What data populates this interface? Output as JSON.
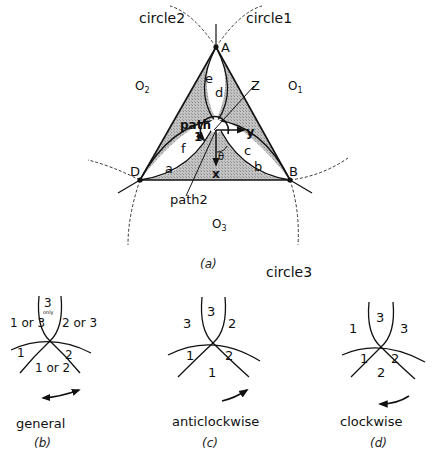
{
  "figure_a": {
    "caption": "(a)",
    "circle_labels": {
      "circle1": "circle1",
      "circle2": "circle2",
      "circle3": "circle3"
    },
    "points": {
      "A": "A",
      "B": "B",
      "D": "D",
      "Z": "Z"
    },
    "centers": {
      "O1": "O",
      "O1_sub": "1",
      "O2": "O",
      "O2_sub": "2",
      "O3": "O",
      "O3_sub": "3"
    },
    "regions": {
      "a": "a",
      "b": "b",
      "c": "c",
      "d": "d",
      "e": "e",
      "f": "f"
    },
    "paths": {
      "path1_line1": "path",
      "path1_line2": "1",
      "path2": "path2"
    },
    "axes": {
      "x": "x",
      "y": "y",
      "theta": "θ"
    },
    "colors": {
      "shade": "#b5b5b5",
      "line": "#111111",
      "dashed": "#333333"
    }
  },
  "figure_b": {
    "caption": "(b)",
    "title": "general",
    "regions": {
      "top": "3",
      "top_note": "only",
      "upper_left": "1 or 3",
      "upper_right": "2 or 3",
      "left": "1",
      "right": "2",
      "bottom": "1 or 2"
    },
    "arrow": "double-headed"
  },
  "figure_c": {
    "caption": "(c)",
    "title": "anticlockwise",
    "regions": {
      "top": "3",
      "upper_left": "3",
      "upper_right": "2",
      "left": "1",
      "right": "2",
      "bottom": "1"
    },
    "arrow": "anticlockwise"
  },
  "figure_d": {
    "caption": "(d)",
    "title": "clockwise",
    "regions": {
      "top": "3",
      "upper_left": "1",
      "upper_right": "3",
      "left": "1",
      "right": "2",
      "bottom": "2"
    },
    "arrow": "clockwise"
  }
}
